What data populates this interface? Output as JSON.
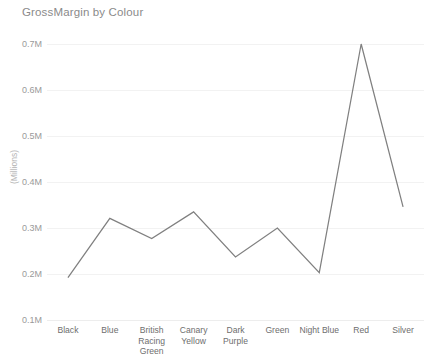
{
  "chart_data": {
    "type": "line",
    "title": "GrossMargin by Colour",
    "xlabel": "",
    "ylabel": "(Millions)",
    "categories": [
      "Black",
      "Blue",
      "British Racing Green",
      "Canary Yellow",
      "Dark Purple",
      "Green",
      "Night Blue",
      "Red",
      "Silver"
    ],
    "values": [
      0.192,
      0.321,
      0.277,
      0.335,
      0.237,
      0.3,
      0.203,
      0.7,
      0.346
    ],
    "series": [
      {
        "name": "GrossMargin",
        "values": [
          0.192,
          0.321,
          0.277,
          0.335,
          0.237,
          0.3,
          0.203,
          0.7,
          0.346
        ],
        "color": "#808080"
      }
    ],
    "ylim": [
      0.1,
      0.7
    ],
    "ytick_labels": [
      "0.7M",
      "0.6M",
      "0.5M",
      "0.4M",
      "0.3M",
      "0.2M",
      "0.1M"
    ],
    "ytick_values": [
      0.7,
      0.6,
      0.5,
      0.4,
      0.3,
      0.2,
      0.1
    ],
    "grid": true,
    "legend": false,
    "legend_position": "none",
    "value_format": "M",
    "line_color": "#808080",
    "gridline_color": "#f2f2f2",
    "title_color": "#8a8a8a",
    "tick_color": "#6e6e6e",
    "background": "#ffffff"
  },
  "xlabel_lines": [
    [
      "Black"
    ],
    [
      "Blue"
    ],
    [
      "British",
      "Racing",
      "Green"
    ],
    [
      "Canary",
      "Yellow"
    ],
    [
      "Dark",
      "Purple"
    ],
    [
      "Green"
    ],
    [
      "Night Blue"
    ],
    [
      "Red"
    ],
    [
      "Silver"
    ]
  ]
}
